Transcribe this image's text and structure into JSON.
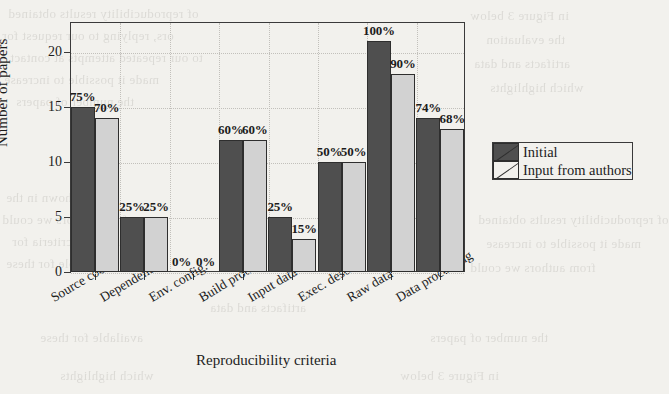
{
  "chart_data": {
    "type": "bar",
    "title": "",
    "xlabel": "Reproducibility criteria",
    "ylabel": "Number of papers",
    "categories": [
      "Source code",
      "Dependencies",
      "Env. config.",
      "Build process",
      "Input data",
      "Exec. descrip.",
      "Raw data",
      "Data processing"
    ],
    "series": [
      {
        "name": "Initial",
        "color": "#4f4f4f",
        "values": [
          15,
          5,
          0,
          12,
          5,
          10,
          21,
          14
        ],
        "labels": [
          "75%",
          "25%",
          "0%",
          "60%",
          "25%",
          "50%",
          "100%",
          "74%"
        ]
      },
      {
        "name": "Input from authors",
        "color": "#d2d2d2",
        "values": [
          14,
          5,
          0,
          12,
          3,
          10,
          18,
          13
        ],
        "labels": [
          "70%",
          "25%",
          "0%",
          "60%",
          "15%",
          "50%",
          "90%",
          "68%"
        ]
      }
    ],
    "yticks": [
      0,
      5,
      10,
      15,
      20
    ],
    "ytick_labels": [
      "0",
      "5",
      "10",
      "15",
      "20"
    ],
    "ylim": [
      0,
      22.7
    ],
    "grid": true,
    "legend_position": "right-outside"
  },
  "legend": {
    "entries": [
      {
        "label": "Initial",
        "swatch": "dark-hatched-swatch"
      },
      {
        "label": "Input from authors",
        "swatch": "light-hatched-swatch"
      }
    ]
  },
  "page_bleed": {
    "lines": [
      "of reproducibility results obtained",
      "ors, replying to our request for",
      "to our repeated attempts at contact",
      "made it possible to increase",
      "the number of papers",
      "as shown in the",
      "from authors we could",
      "additional criteria for",
      "available for these",
      "in Figure 3 below",
      "the evaluation",
      "artifacts and data",
      "which highlights"
    ]
  }
}
